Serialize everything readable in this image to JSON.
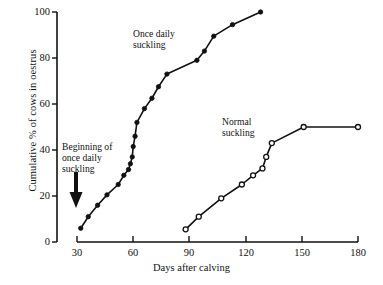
{
  "chart_data": {
    "type": "line",
    "title": "",
    "xlabel": "Days after calving",
    "ylabel": "Cumulative % of cows in oestrus",
    "xlim": [
      25,
      180
    ],
    "ylim": [
      0,
      100
    ],
    "grid": false,
    "legend_position": "inline-annotation",
    "xticks": [
      "30",
      "60",
      "90",
      "120",
      "150",
      "180"
    ],
    "xtick_values": [
      30,
      60,
      90,
      120,
      150,
      180
    ],
    "yticks": [
      "0",
      "20",
      "40",
      "60",
      "80",
      "100"
    ],
    "ytick_values": [
      0,
      20,
      40,
      60,
      80,
      100
    ],
    "annotations": [
      {
        "name": "beginning-of-once-daily-suckling",
        "text": "Beginning of\nonce daily\nsuckling",
        "x": 32,
        "y": 40,
        "arrow": "down"
      },
      {
        "name": "once-daily-suckling-label",
        "text": "Once daily\nsuckling",
        "x": 68,
        "y": 93
      },
      {
        "name": "normal-suckling-label",
        "text": "Normal\nsuckling",
        "x": 115,
        "y": 55
      }
    ],
    "series": [
      {
        "name": "Once daily suckling",
        "marker": "filled-circle",
        "color": "#111111",
        "points": [
          [
            32,
            6
          ],
          [
            36,
            11
          ],
          [
            41,
            16
          ],
          [
            46,
            20.5
          ],
          [
            52,
            25
          ],
          [
            55,
            29
          ],
          [
            57.5,
            31.5
          ],
          [
            58.5,
            34
          ],
          [
            59.5,
            37
          ],
          [
            60,
            41.5
          ],
          [
            61,
            46
          ],
          [
            62,
            52
          ],
          [
            66,
            58
          ],
          [
            70,
            62.5
          ],
          [
            73.5,
            67.5
          ],
          [
            78,
            73
          ],
          [
            94,
            79
          ],
          [
            98,
            83
          ],
          [
            103,
            89.5
          ],
          [
            113,
            94.5
          ],
          [
            128,
            100
          ]
        ]
      },
      {
        "name": "Normal suckling",
        "marker": "open-circle",
        "color": "#111111",
        "points": [
          [
            88,
            5.5
          ],
          [
            95,
            11
          ],
          [
            107,
            19
          ],
          [
            118,
            25
          ],
          [
            124,
            29
          ],
          [
            129,
            32
          ],
          [
            131,
            37
          ],
          [
            134,
            43
          ],
          [
            151,
            50
          ],
          [
            180,
            50
          ]
        ]
      }
    ]
  }
}
